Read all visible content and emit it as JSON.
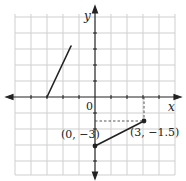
{
  "figure": {
    "type": "coordinate-plane-graph",
    "grid": {
      "unit_px": 16,
      "x_range": [
        -5,
        5
      ],
      "y_range": [
        -5,
        5
      ],
      "grid_color": "#cfcfcf"
    },
    "axes": {
      "x_label": "x",
      "y_label": "y",
      "origin_label": "0",
      "axis_color": "#222222"
    },
    "segments": [
      {
        "name": "upper-left-segment",
        "from": [
          -3,
          0
        ],
        "to": [
          -1.5,
          3.25
        ],
        "endpoints_marked": false
      },
      {
        "name": "lower-right-segment",
        "from": [
          0,
          -3
        ],
        "to": [
          3,
          -1.5
        ],
        "endpoints_marked": true
      }
    ],
    "points": [
      {
        "label": "(0, −3)",
        "x": 0,
        "y": -3
      },
      {
        "label": "(3, −1.5)",
        "x": 3,
        "y": -1.5
      }
    ],
    "guides": [
      {
        "type": "dashed",
        "from": [
          3,
          0
        ],
        "to": [
          3,
          -1.5
        ]
      },
      {
        "type": "dashed",
        "from": [
          0,
          -1.5
        ],
        "to": [
          3,
          -1.5
        ]
      }
    ],
    "colors": {
      "line": "#222222",
      "grid": "#cfcfcf",
      "background": "#ffffff"
    }
  }
}
